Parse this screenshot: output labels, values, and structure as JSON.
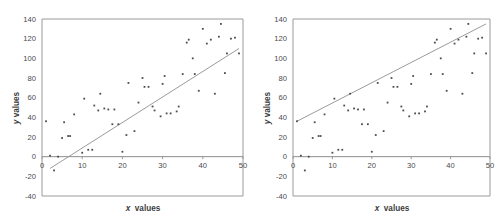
{
  "figure": {
    "background": "#ffffff",
    "marker_color": "#4d4d4d",
    "line_color": "#9b9b9b",
    "frame_color": "#9a9a9a"
  },
  "chart_data": [
    {
      "type": "scatter",
      "title": "",
      "panel": "left",
      "xlabel": "x values",
      "ylabel": "y values",
      "xlim": [
        0,
        50
      ],
      "ylim": [
        -40,
        140
      ],
      "xticks": [
        0,
        10,
        20,
        30,
        40,
        50
      ],
      "yticks": [
        -40,
        -20,
        0,
        20,
        40,
        60,
        80,
        100,
        120,
        140
      ],
      "grid": false,
      "legend": "none",
      "x": [
        1,
        2,
        3,
        4,
        5,
        5.5,
        6.5,
        7,
        8,
        10,
        10.5,
        11.5,
        12.5,
        13,
        14,
        14.5,
        15.5,
        16.5,
        17.5,
        18,
        19,
        20,
        21,
        21.5,
        23,
        24,
        25,
        25.5,
        26.5,
        27.5,
        28,
        29.5,
        30,
        30.5,
        31,
        32,
        33.5,
        34,
        35,
        36,
        36.5,
        37.5,
        38,
        39,
        40,
        41,
        42,
        43,
        44,
        44.5,
        45.5,
        46,
        47,
        48,
        49
      ],
      "y": [
        36,
        1,
        -14,
        0,
        19,
        35,
        21,
        21,
        43,
        4,
        59,
        7,
        7,
        52,
        47,
        64,
        49,
        48,
        33,
        48,
        33,
        5,
        22,
        75,
        26,
        55,
        80,
        71,
        71,
        51,
        47,
        41,
        74,
        82,
        44,
        44,
        46,
        51,
        84,
        116,
        119,
        100,
        84,
        67,
        130,
        115,
        119,
        64,
        122,
        135,
        85,
        105,
        120,
        121,
        105
      ],
      "series_note": "observed data points",
      "fit_line": {
        "label": "fitted line",
        "x_start": 2,
        "y_start": -12,
        "x_end": 49,
        "y_end": 110
      }
    },
    {
      "type": "scatter",
      "title": "",
      "panel": "right",
      "xlabel": "x values",
      "ylabel": "y values",
      "xlim": [
        0,
        50
      ],
      "ylim": [
        -40,
        140
      ],
      "xticks": [
        0,
        10,
        20,
        30,
        40,
        50
      ],
      "yticks": [
        -40,
        -20,
        0,
        20,
        40,
        60,
        80,
        100,
        120,
        140
      ],
      "grid": false,
      "legend": "none",
      "x": [
        1,
        2,
        3,
        4,
        5,
        5.5,
        6.5,
        7,
        8,
        10,
        10.5,
        11.5,
        12.5,
        13,
        14,
        14.5,
        15.5,
        16.5,
        17.5,
        18,
        19,
        20,
        21,
        21.5,
        23,
        24,
        25,
        25.5,
        26.5,
        27.5,
        28,
        29.5,
        30,
        30.5,
        31,
        32,
        33.5,
        34,
        35,
        36,
        36.5,
        37.5,
        38,
        39,
        40,
        41,
        42,
        43,
        44,
        44.5,
        45.5,
        46,
        47,
        48,
        49
      ],
      "y": [
        36,
        1,
        -14,
        0,
        19,
        35,
        21,
        21,
        43,
        4,
        59,
        7,
        7,
        52,
        47,
        64,
        49,
        48,
        33,
        48,
        33,
        5,
        22,
        75,
        26,
        55,
        80,
        71,
        71,
        51,
        47,
        41,
        74,
        82,
        44,
        44,
        46,
        51,
        84,
        116,
        119,
        100,
        84,
        67,
        130,
        115,
        119,
        64,
        122,
        135,
        85,
        105,
        120,
        121,
        105
      ],
      "series_note": "observed data points",
      "fit_line": {
        "label": "upper envelope line",
        "x_start": 1,
        "y_start": 36,
        "x_end": 49,
        "y_end": 135
      }
    }
  ]
}
